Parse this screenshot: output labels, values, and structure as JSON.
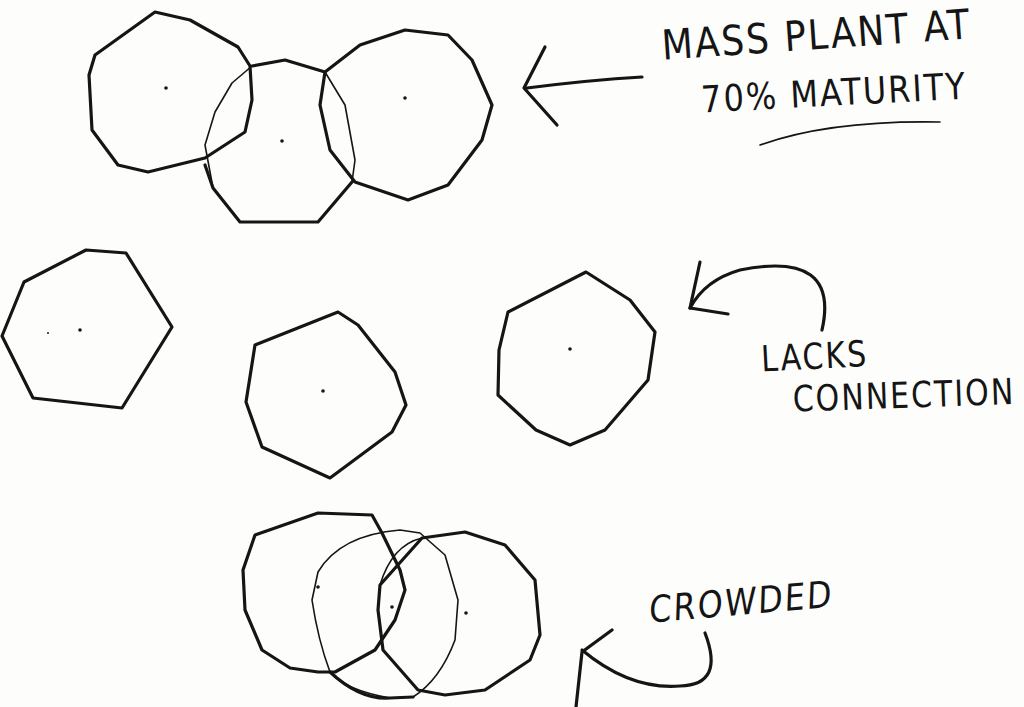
{
  "sketch": {
    "title": "Planting spacing sketch",
    "ink_color": "#151515",
    "paper_color": "#fdfdfc"
  },
  "annotations": {
    "mass_plant": {
      "line1": "MASS PLANT AT",
      "line2_prefix": "70%",
      "line2_emphasis": "MATURITY"
    },
    "lacks_connection": {
      "line1": "LACKS",
      "line2": "CONNECTION"
    },
    "crowded": {
      "line1": "CROWDED"
    }
  },
  "groups": [
    {
      "id": "row-1",
      "label": "Mass plant at 70% maturity",
      "plants": 3,
      "arrangement": "overlapping slightly"
    },
    {
      "id": "row-2",
      "label": "Lacks connection",
      "plants": 3,
      "arrangement": "spaced apart"
    },
    {
      "id": "row-3",
      "label": "Crowded",
      "plants": 3,
      "arrangement": "heavily overlapping"
    }
  ]
}
